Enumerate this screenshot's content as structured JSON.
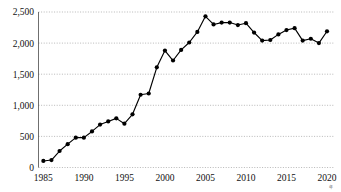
{
  "chart_data": {
    "type": "line",
    "title": "",
    "subtitle": "",
    "xlabel": "",
    "ylabel": "",
    "xlim": [
      1984.4,
      2020.8
    ],
    "ylim": [
      0,
      2500
    ],
    "grid": true,
    "grid_axis": "y",
    "legend": false,
    "legend_position": "none",
    "marker": "filled-circle",
    "line_color": "#000000",
    "marker_color": "#000000",
    "background_color": "#ffffff",
    "gridline_color": "#9a9a9a",
    "x": [
      1985,
      1986,
      1987,
      1988,
      1989,
      1990,
      1991,
      1992,
      1993,
      1994,
      1995,
      1996,
      1997,
      1998,
      1999,
      2000,
      2001,
      2002,
      2003,
      2004,
      2005,
      2006,
      2007,
      2008,
      2009,
      2010,
      2011,
      2012,
      2013,
      2014,
      2015,
      2016,
      2017,
      2018,
      2019,
      2020
    ],
    "values": [
      105,
      120,
      265,
      375,
      480,
      480,
      580,
      690,
      740,
      790,
      705,
      855,
      1170,
      1190,
      1610,
      1880,
      1720,
      1890,
      2010,
      2180,
      2430,
      2300,
      2330,
      2330,
      2290,
      2320,
      2170,
      2040,
      2050,
      2140,
      2210,
      2240,
      2040,
      2070,
      2000,
      2190
    ],
    "series": [
      {
        "name": "series-1",
        "values": [
          105,
          120,
          265,
          375,
          480,
          480,
          580,
          690,
          740,
          790,
          705,
          855,
          1170,
          1190,
          1610,
          1880,
          1720,
          1890,
          2010,
          2180,
          2430,
          2300,
          2330,
          2330,
          2290,
          2320,
          2170,
          2040,
          2050,
          2140,
          2210,
          2240,
          2040,
          2070,
          2000,
          2190
        ]
      }
    ],
    "y_ticks": [
      0,
      500,
      1000,
      1500,
      2000,
      2500
    ],
    "y_tick_labels": [
      "0",
      "500",
      "1,000",
      "1,500",
      "2,000",
      "2,500"
    ],
    "x_ticks": [
      1985,
      1990,
      1995,
      2000,
      2005,
      2010,
      2015,
      2020
    ],
    "x_tick_labels": [
      "1985",
      "1990",
      "1995",
      "2000",
      "2005",
      "2010",
      "2015",
      "2020"
    ],
    "x_axis_unit": "年",
    "annotations": []
  }
}
